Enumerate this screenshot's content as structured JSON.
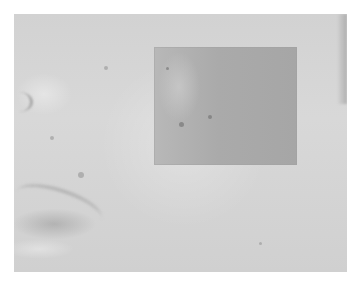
{
  "image": {
    "description": "Grayscale close-up photograph of facial skin with a magnified inset region",
    "background_color": "#ffffff",
    "photo_tone": "#d4d4d4",
    "inset_tone": "#aaaaaa"
  }
}
